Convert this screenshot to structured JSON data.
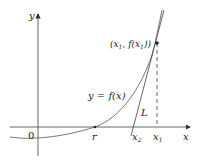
{
  "diagram": {
    "axes": {
      "x_label": "x",
      "y_label": "y",
      "origin_label": "0"
    },
    "curve": {
      "label": "y = f(x)"
    },
    "tangent": {
      "label": "L"
    },
    "point": {
      "label_open": "(",
      "label_x": "x",
      "label_x_sub": "1",
      "label_mid": ", f(",
      "label_x2": "x",
      "label_x2_sub": "1",
      "label_close": "))"
    },
    "x_markers": {
      "r": "r",
      "x2": "x",
      "x2_sub": "2",
      "x1": "x",
      "x1_sub": "1"
    },
    "colors": {
      "axis": "#333333",
      "curve": "#555555",
      "tangent": "#444444",
      "point": "#222222"
    }
  }
}
